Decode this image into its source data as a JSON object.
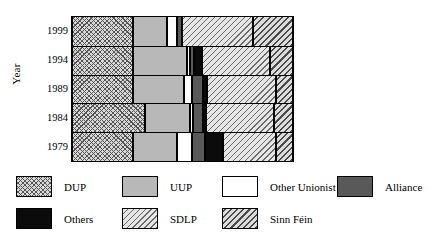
{
  "chart_data": {
    "type": "bar",
    "orientation": "horizontal",
    "stacked": true,
    "stack_mode": "percent",
    "title": "",
    "xlabel": "",
    "ylabel": "Year",
    "grid": false,
    "legend_position": "bottom",
    "xlim": [
      0,
      100
    ],
    "categories": [
      "1999",
      "1994",
      "1989",
      "1984",
      "1979"
    ],
    "series": [
      {
        "name": "DUP",
        "values": [
          27.8,
          27.8,
          27.8,
          33.2,
          27.4
        ]
      },
      {
        "name": "UUP",
        "values": [
          15.2,
          24.4,
          22.9,
          20.2,
          20.2
        ]
      },
      {
        "name": "Other Unionist",
        "values": [
          4.5,
          1.3,
          3.6,
          1.3,
          6.7
        ]
      },
      {
        "name": "Alliance",
        "values": [
          2.2,
          1.8,
          4.9,
          4.5,
          5.8
        ]
      },
      {
        "name": "Others",
        "values": [
          0.0,
          3.6,
          1.8,
          1.3,
          8.1
        ]
      },
      {
        "name": "SDLP",
        "values": [
          32.3,
          30.5,
          31.4,
          31.0,
          24.2
        ]
      },
      {
        "name": "Sinn Féin",
        "values": [
          18.0,
          10.6,
          7.6,
          8.5,
          7.6
        ]
      }
    ],
    "colors": {
      "DUP": "#d8d8d8",
      "UUP": "#b8b8b8",
      "Other Unionist": "#ffffff",
      "Alliance": "#595959",
      "Others": "#0b0b0b",
      "SDLP": "#e6e6e6",
      "Sinn Féin": "#dcdcdc"
    },
    "patterns": {
      "DUP": "crosshatch",
      "UUP": "solid-gray",
      "Other Unionist": "solid-white",
      "Alliance": "solid-dark-gray",
      "Others": "solid-black",
      "SDLP": "diagonal-thin",
      "Sinn Féin": "diagonal-thick"
    }
  },
  "axis": {
    "y_title": "Year",
    "y_ticks": [
      "1999",
      "1994",
      "1989",
      "1984",
      "1979"
    ]
  },
  "legend": {
    "entries": [
      {
        "label": "DUP"
      },
      {
        "label": "UUP"
      },
      {
        "label": "Other Unionist"
      },
      {
        "label": "Alliance"
      },
      {
        "label": "Others"
      },
      {
        "label": "SDLP"
      },
      {
        "label": "Sinn Féin"
      }
    ]
  }
}
